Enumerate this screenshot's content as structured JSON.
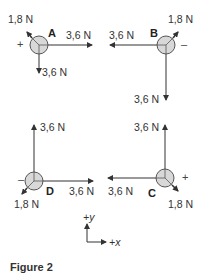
{
  "figure": {
    "caption": "Figure 2",
    "colors": {
      "line": "#333333",
      "disk_fill": "#d8d8d8",
      "disk_stroke": "#555555"
    },
    "points": [
      {
        "id": "A",
        "sign": "+",
        "force_x": "3,6 N",
        "force_y": "3,6 N",
        "force_diag": "1,8 N"
      },
      {
        "id": "B",
        "sign": "–",
        "force_x": "3,6 N",
        "force_y": "3,6 N",
        "force_diag": "1,8 N"
      },
      {
        "id": "C",
        "sign": "+",
        "force_x": "3,6 N",
        "force_y": "3,6 N",
        "force_diag": "1,8 N"
      },
      {
        "id": "D",
        "sign": "–",
        "force_x": "3,6 N",
        "force_y": "3,6 N",
        "force_diag": "1,8 N"
      }
    ],
    "axes": {
      "y_label": "+y",
      "x_label": "+x"
    }
  }
}
